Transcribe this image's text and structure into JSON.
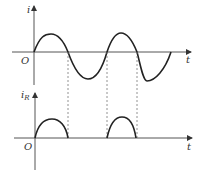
{
  "diagram": {
    "top_graph": {
      "y_label": "i",
      "x_label": "t",
      "origin_label": "O",
      "curve": "sinusoid"
    },
    "bottom_graph": {
      "y_label": "i",
      "y_label_subscript": "R",
      "x_label": "t",
      "origin_label": "O",
      "curve": "half-wave rectified sinusoid"
    },
    "colors": {
      "stroke": "#222222",
      "axis": "#555555",
      "dashed": "#777777"
    }
  }
}
